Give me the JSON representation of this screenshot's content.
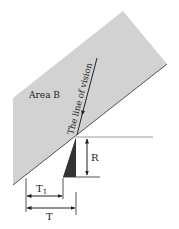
{
  "diagram": {
    "area_label": "Area B",
    "vision_label": "The line of vision",
    "dimension_R": "R",
    "dimension_T1_main": "T",
    "dimension_T1_sub": "1",
    "dimension_T": "T"
  },
  "colors": {
    "area_fill": "#d2d2d2",
    "area_edge": "#555555",
    "triangle_fill": "#333333",
    "line": "#333333",
    "guide_line": "#9a9a9a"
  }
}
